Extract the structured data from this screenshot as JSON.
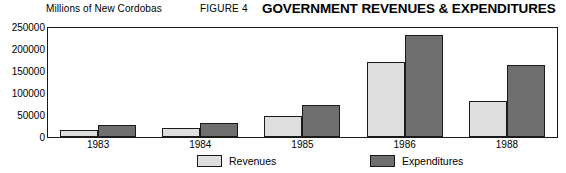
{
  "header": {
    "unit_label": "Millions of New Cordobas",
    "figure_number": "FIGURE 4",
    "title": "GOVERNMENT REVENUES & EXPENDITURES"
  },
  "colors": {
    "revenues": "#dedede",
    "expenditures": "#6f6f6f",
    "frame": "#1a1a1a",
    "background": "#ffffff"
  },
  "legend": {
    "position": "bottom-center",
    "items": [
      {
        "label": "Revenues",
        "color": "#dedede"
      },
      {
        "label": "Expenditures",
        "color": "#6f6f6f"
      }
    ]
  },
  "chart_data": {
    "type": "bar",
    "title": "GOVERNMENT REVENUES & EXPENDITURES",
    "subtitle": "FIGURE 4",
    "xlabel": "",
    "ylabel": "Millions of New Cordobas",
    "categories": [
      "1983",
      "1984",
      "1985",
      "1986",
      "1988"
    ],
    "series": [
      {
        "name": "Revenues",
        "values": [
          14000,
          20000,
          48000,
          170000,
          82000
        ]
      },
      {
        "name": "Expenditures",
        "values": [
          27000,
          31000,
          73000,
          232000,
          163000
        ]
      }
    ],
    "ylim": [
      0,
      250000
    ],
    "yticks": [
      0,
      50000,
      100000,
      150000,
      200000,
      250000
    ],
    "ytick_labels": [
      "0",
      "50000",
      "100000",
      "150000",
      "200000",
      "250000"
    ],
    "grid": false,
    "legend_position": "bottom-center"
  }
}
